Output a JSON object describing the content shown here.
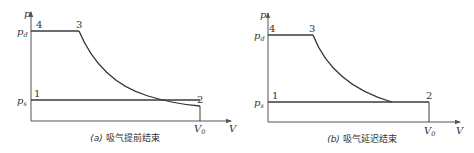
{
  "diagrams": [
    {
      "id": "a",
      "caption_prefix": "(a)",
      "caption_text": "吸气提前结束",
      "y_axis_label": "p",
      "x_axis_label": "V",
      "pd_label": "p",
      "pd_sub": "d",
      "ps_label": "p",
      "ps_sub": "s",
      "v0_label": "V",
      "v0_sub": "0",
      "points": {
        "p1": "1",
        "p2": "2",
        "p3": "3",
        "p4": "4"
      }
    },
    {
      "id": "b",
      "caption_prefix": "(b)",
      "caption_text": "吸气延迟结束",
      "y_axis_label": "p",
      "x_axis_label": "V",
      "pd_label": "p",
      "pd_sub": "d",
      "ps_label": "p",
      "ps_sub": "s",
      "v0_label": "V",
      "v0_sub": "0",
      "points": {
        "p1": "1",
        "p2": "2",
        "p3": "3",
        "p4": "4"
      }
    }
  ],
  "colors": {
    "line": "#333333",
    "background": "#ffffff"
  }
}
